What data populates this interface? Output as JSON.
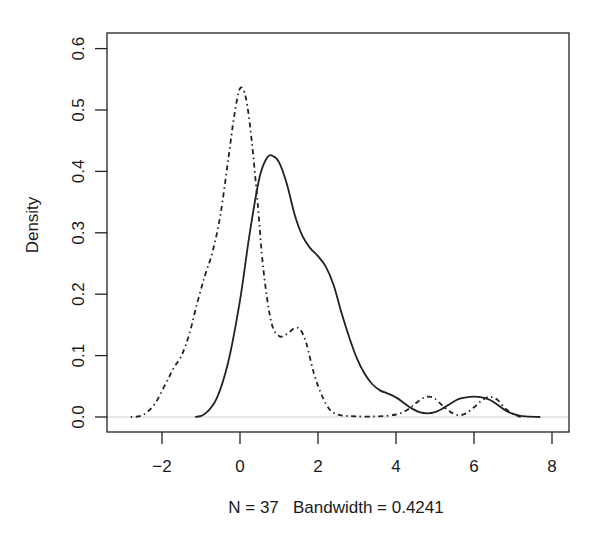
{
  "chart_data": {
    "type": "line",
    "title": "",
    "xlabel": "N = 37   Bandwidth = 0.4241",
    "ylabel": "Density",
    "xlim": [
      -3.5,
      8.4
    ],
    "ylim": [
      -0.024,
      0.625
    ],
    "x_ticks": [
      -2,
      0,
      2,
      4,
      6,
      8
    ],
    "x_tick_labels": [
      "−2",
      "0",
      "2",
      "4",
      "6",
      "8"
    ],
    "y_ticks": [
      0.0,
      0.1,
      0.2,
      0.3,
      0.4,
      0.5,
      0.6
    ],
    "y_tick_labels": [
      "0.0",
      "0.1",
      "0.2",
      "0.3",
      "0.4",
      "0.5",
      "0.6"
    ],
    "grid": false,
    "legend": null,
    "zero_line": true,
    "series": [
      {
        "name": "solid density",
        "style": "solid",
        "color": "#222222",
        "x": [
          -1.15,
          -0.9,
          -0.6,
          -0.3,
          0.0,
          0.25,
          0.5,
          0.7,
          0.85,
          1.0,
          1.2,
          1.4,
          1.6,
          1.8,
          2.0,
          2.2,
          2.4,
          2.6,
          2.8,
          3.0,
          3.2,
          3.4,
          3.6,
          3.8,
          4.0,
          4.2,
          4.4,
          4.6,
          4.8,
          5.0,
          5.2,
          5.4,
          5.6,
          5.8,
          6.0,
          6.2,
          6.4,
          6.6,
          6.8,
          7.0,
          7.2,
          7.4,
          7.7
        ],
        "y": [
          0.0,
          0.005,
          0.03,
          0.09,
          0.19,
          0.3,
          0.39,
          0.423,
          0.425,
          0.415,
          0.38,
          0.33,
          0.295,
          0.275,
          0.262,
          0.245,
          0.215,
          0.17,
          0.13,
          0.095,
          0.07,
          0.053,
          0.043,
          0.038,
          0.032,
          0.023,
          0.014,
          0.008,
          0.006,
          0.008,
          0.014,
          0.022,
          0.029,
          0.032,
          0.033,
          0.032,
          0.028,
          0.02,
          0.011,
          0.005,
          0.002,
          0.0005,
          0.0
        ]
      },
      {
        "name": "dot-dash density",
        "style": "dotdash",
        "color": "#222222",
        "x": [
          -2.8,
          -2.5,
          -2.2,
          -1.9,
          -1.7,
          -1.5,
          -1.3,
          -1.1,
          -0.9,
          -0.7,
          -0.5,
          -0.3,
          -0.15,
          0.0,
          0.15,
          0.3,
          0.45,
          0.6,
          0.8,
          1.0,
          1.2,
          1.4,
          1.55,
          1.7,
          1.9,
          2.1,
          2.3,
          2.5,
          2.7,
          3.0,
          3.5,
          4.0,
          4.3,
          4.5,
          4.7,
          4.85,
          5.0,
          5.2,
          5.4,
          5.6,
          5.8,
          6.0,
          6.2,
          6.4,
          6.6,
          6.8,
          7.0,
          7.2
        ],
        "y": [
          0.0,
          0.003,
          0.02,
          0.055,
          0.08,
          0.1,
          0.135,
          0.185,
          0.23,
          0.27,
          0.33,
          0.42,
          0.49,
          0.535,
          0.52,
          0.45,
          0.35,
          0.24,
          0.155,
          0.132,
          0.135,
          0.145,
          0.142,
          0.12,
          0.07,
          0.035,
          0.012,
          0.004,
          0.002,
          0.001,
          0.001,
          0.004,
          0.012,
          0.022,
          0.031,
          0.033,
          0.03,
          0.018,
          0.008,
          0.003,
          0.006,
          0.016,
          0.027,
          0.033,
          0.028,
          0.014,
          0.005,
          0.0
        ]
      }
    ]
  },
  "axes": {
    "ylabel": "Density",
    "xlabel": "N = 37   Bandwidth = 0.4241"
  }
}
